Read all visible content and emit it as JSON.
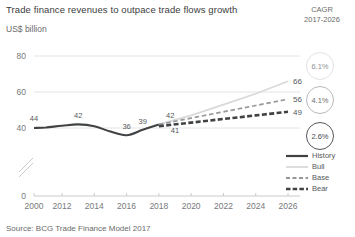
{
  "title": "Trade finance revenues to outpace trade flows growth",
  "unit_label": "US$ billion",
  "source": "Source: BCG Trade Finance Model 2017",
  "cagr_header": {
    "line1": "CAGR",
    "line2": "2017-2026"
  },
  "cagr_badges": [
    {
      "name": "bull",
      "value": "6.1%"
    },
    {
      "name": "base",
      "value": "4.1%"
    },
    {
      "name": "bear",
      "value": "2.6%"
    }
  ],
  "legend": {
    "items": [
      {
        "label": "History",
        "style": "solid",
        "color": "#404244"
      },
      {
        "label": "Bull",
        "style": "solid-light",
        "color": "#d8d9da"
      },
      {
        "label": "Base",
        "style": "dashed",
        "color": "#96989a"
      },
      {
        "label": "Bear",
        "style": "dash-heavy",
        "color": "#404244"
      }
    ]
  },
  "chart_data": {
    "type": "line",
    "title": "Trade finance revenues to outpace trade flows growth",
    "xlabel": "",
    "ylabel": "US$ billion",
    "ylim": [
      0,
      80
    ],
    "yticks": [
      0,
      40,
      60,
      80
    ],
    "ytick_labels": [
      "0",
      "40",
      "60",
      "80"
    ],
    "y_axis_break": true,
    "grid": true,
    "legend_position": "bottom-right",
    "xticks": [
      2000,
      2012,
      2014,
      2016,
      2018,
      2020,
      2022,
      2024,
      2026
    ],
    "xtick_labels": [
      "2000",
      "2012",
      "2014",
      "2016",
      "2018",
      "2020",
      "2022",
      "2024",
      "2026"
    ],
    "x_axis_break": true,
    "series": [
      {
        "name": "History",
        "style": "solid",
        "color": "#404244",
        "x": [
          2000,
          2011,
          2012,
          2013,
          2014,
          2015,
          2016,
          2017,
          2018
        ],
        "values": [
          40,
          40.3,
          41.2,
          42,
          41,
          38,
          36,
          39,
          42
        ]
      },
      {
        "name": "Bull",
        "style": "solid-light",
        "color": "#d8d9da",
        "x": [
          2018,
          2020,
          2022,
          2024,
          2026
        ],
        "values": [
          42,
          47,
          53,
          59,
          66
        ]
      },
      {
        "name": "Base",
        "style": "dashed",
        "color": "#96989a",
        "x": [
          2018,
          2020,
          2022,
          2024,
          2026
        ],
        "values": [
          42,
          45.5,
          49,
          52.5,
          56
        ]
      },
      {
        "name": "Bear",
        "style": "dash-heavy",
        "color": "#404244",
        "x": [
          2018,
          2020,
          2022,
          2024,
          2026
        ],
        "values": [
          41,
          43,
          45,
          47,
          49
        ]
      }
    ],
    "point_labels": [
      {
        "text": "44",
        "x": 2001.2,
        "y": 44,
        "anchor": "middle"
      },
      {
        "text": "42",
        "x": 2013,
        "y": 45.5,
        "anchor": "middle"
      },
      {
        "text": "36",
        "x": 2016,
        "y": 39.2,
        "anchor": "middle"
      },
      {
        "text": "39",
        "x": 2017,
        "y": 42.5,
        "anchor": "middle"
      },
      {
        "text": "42",
        "x": 2018.7,
        "y": 45.8,
        "anchor": "middle"
      },
      {
        "text": "41",
        "x": 2019,
        "y": 37.2,
        "anchor": "middle"
      }
    ],
    "end_labels": [
      {
        "text": "66",
        "series": "Bull",
        "value": 66
      },
      {
        "text": "56",
        "series": "Base",
        "value": 56
      },
      {
        "text": "49",
        "series": "Bear",
        "value": 49
      }
    ]
  }
}
